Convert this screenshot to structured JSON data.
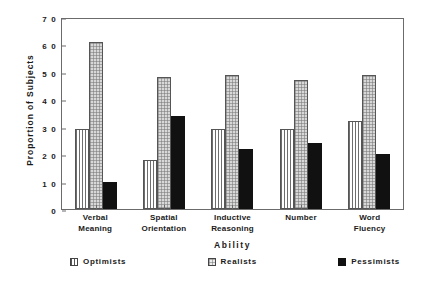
{
  "chart_data": {
    "type": "bar",
    "title": "",
    "xlabel": "Ability",
    "ylabel": "Proportion  of  Subjects",
    "categories": [
      "Verbal\nMeaning",
      "Spatial\nOrientation",
      "Inductive\nReasoning",
      "Number",
      "Word\nFluency"
    ],
    "category_lines": [
      [
        "Verbal",
        "Meaning"
      ],
      [
        "Spatial",
        "Orientation"
      ],
      [
        "Inductive",
        "Reasoning"
      ],
      [
        "Number",
        ""
      ],
      [
        "Word",
        "Fluency"
      ]
    ],
    "series": [
      {
        "name": "Optimists",
        "pattern": "vertical-stripes",
        "values": [
          29,
          18,
          29,
          29,
          32
        ]
      },
      {
        "name": "Realists",
        "pattern": "stipple-dots",
        "values": [
          61,
          48,
          49,
          47,
          49
        ]
      },
      {
        "name": "Pessimists",
        "pattern": "solid-black",
        "values": [
          10,
          34,
          22,
          24,
          20
        ]
      }
    ],
    "ylim": [
      0,
      70
    ],
    "yticks": [
      0,
      10,
      20,
      30,
      40,
      50,
      60,
      70
    ],
    "ytick_labels": [
      "0",
      "1 0",
      "2 0",
      "3 0",
      "4 0",
      "5 0",
      "6 0",
      "7 0"
    ],
    "grid": false,
    "legend_position": "bottom",
    "frame": true,
    "colors": {
      "axis": "#6b6b6b",
      "text": "#1a1a1a",
      "optimists": "#ffffff",
      "realists": "#d8d8d8",
      "pessimists": "#111111"
    }
  },
  "legend": {
    "items": [
      {
        "label": "Optimists"
      },
      {
        "label": "Realists"
      },
      {
        "label": "Pessimists"
      }
    ]
  }
}
